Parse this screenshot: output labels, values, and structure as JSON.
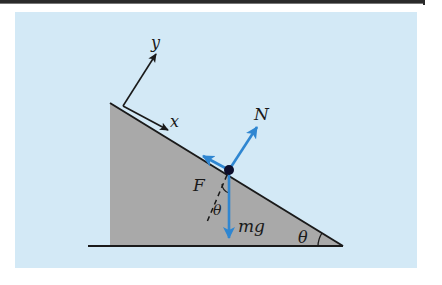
{
  "diagram": {
    "title": "",
    "colors": {
      "background": "#d3e9f6",
      "wedge_fill": "#a9a9a9",
      "line": "#1a1a1a",
      "force_arrow": "#2f86d1",
      "block_dot": "#0d0d2a"
    },
    "labels": {
      "y_axis": "y",
      "x_axis": "x",
      "normal_force": "N",
      "friction_force": "F",
      "weight": "mg",
      "angle_at_dot": "θ",
      "angle_at_base": "θ"
    },
    "nodes": [
      {
        "id": "wedge",
        "type": "right-triangle",
        "vertices": [
          [
            110,
            103
          ],
          [
            110,
            246
          ],
          [
            343,
            246
          ]
        ]
      },
      {
        "id": "ground",
        "type": "line",
        "from": [
          88,
          246
        ],
        "to": [
          343,
          246
        ]
      },
      {
        "id": "block",
        "type": "point",
        "at": [
          229,
          170
        ]
      }
    ],
    "edges": [
      {
        "id": "y-axis-arrow",
        "from": [
          123,
          106
        ],
        "to": [
          156,
          53
        ],
        "label": "y"
      },
      {
        "id": "x-axis-arrow",
        "from": [
          123,
          106
        ],
        "to": [
          168,
          130
        ],
        "label": "x"
      },
      {
        "id": "normal-force",
        "from": [
          229,
          170
        ],
        "to": [
          257,
          127
        ],
        "label": "N"
      },
      {
        "id": "friction-force",
        "from": [
          229,
          170
        ],
        "to": [
          204,
          157
        ],
        "label": "F"
      },
      {
        "id": "weight-force",
        "from": [
          229,
          170
        ],
        "to": [
          229,
          237
        ],
        "label": "mg"
      },
      {
        "id": "normal-dashed-extension",
        "from": [
          229,
          170
        ],
        "to": [
          207,
          222
        ],
        "style": "dashed"
      }
    ]
  }
}
